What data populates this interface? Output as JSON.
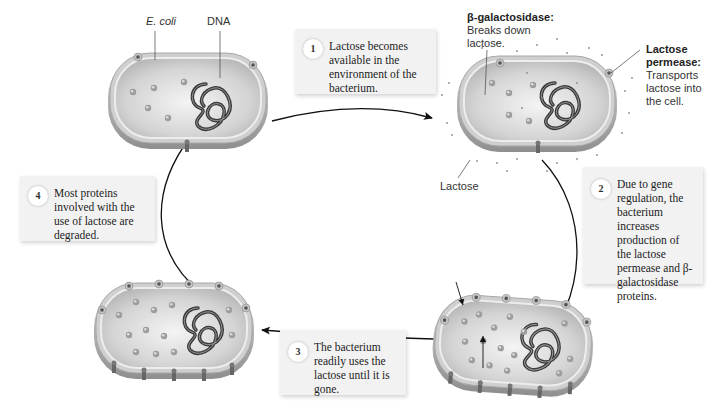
{
  "labels": {
    "ecoli": "E. coli",
    "dna": "DNA",
    "beta_gal_title": "β-galactosidase:",
    "beta_gal_desc_1": "Breaks down",
    "beta_gal_desc_2": "lactose.",
    "permease_title_1": "Lactose",
    "permease_title_2": "permease:",
    "permease_desc_1": "Transports",
    "permease_desc_2": "lactose into",
    "permease_desc_3": "the cell.",
    "lactose": "Lactose"
  },
  "steps": [
    {
      "number": "1",
      "text": "Lactose becomes available in the environment of the bacterium."
    },
    {
      "number": "2",
      "text": "Due to gene regulation, the bacterium increases production of the lactose permease and β-galactosidase proteins."
    },
    {
      "number": "3",
      "text": "The bacterium readily uses the lactose until it is gone."
    },
    {
      "number": "4",
      "text": "Most proteins involved with the use of lactose are degraded."
    }
  ],
  "colors": {
    "cell_membrane": "#bdbdbd",
    "cell_interior": "#d9d9d9",
    "dna": "#444444",
    "box_bg": "#f2f2f2",
    "arrow": "#111111"
  }
}
